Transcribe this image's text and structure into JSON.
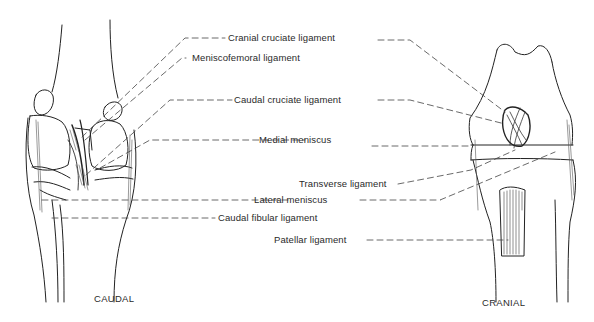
{
  "figure": {
    "views": {
      "caudal": "CAUDAL",
      "cranial": "CRANIAL"
    },
    "labels": [
      {
        "id": "cranial-cruciate-ligament",
        "text": "Cranial cruciate ligament"
      },
      {
        "id": "meniscofemoral-ligament",
        "text": "Meniscofemoral ligament"
      },
      {
        "id": "caudal-cruciate-ligament",
        "text": "Caudal cruciate ligament"
      },
      {
        "id": "medial-meniscus",
        "text": "Medial meniscus"
      },
      {
        "id": "transverse-ligament",
        "text": "Transverse ligament"
      },
      {
        "id": "lateral-meniscus",
        "text": "Lateral meniscus"
      },
      {
        "id": "caudal-fibular-ligament",
        "text": "Caudal fibular ligament"
      },
      {
        "id": "patellar-ligament",
        "text": "Patellar ligament"
      }
    ]
  }
}
